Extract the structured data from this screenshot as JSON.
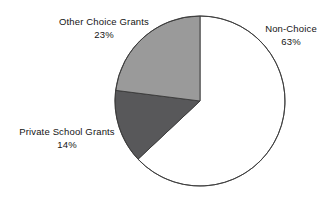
{
  "chart_data": {
    "type": "pie",
    "title": "",
    "subtitle": "",
    "xlabel": "",
    "ylabel": "",
    "legend_position": "none",
    "grid": false,
    "units": "percent",
    "start_angle_deg": 0,
    "direction": "clockwise",
    "categories": [
      "Non-Choice",
      "Private School Grants",
      "Other Choice Grants"
    ],
    "values": [
      63,
      14,
      23
    ],
    "slices": [
      {
        "label": "Non-Choice",
        "value": 63,
        "value_label": "63%",
        "color": "#ffffff",
        "stroke": "#3a3a3a",
        "start_pct": 0,
        "end_pct": 63
      },
      {
        "label": "Private School Grants",
        "value": 14,
        "value_label": "14%",
        "color": "#58585a",
        "stroke": "#3a3a3a",
        "start_pct": 63,
        "end_pct": 77
      },
      {
        "label": "Other Choice Grants",
        "value": 23,
        "value_label": "23%",
        "color": "#9a9a9a",
        "stroke": "#3a3a3a",
        "start_pct": 77,
        "end_pct": 100
      }
    ]
  },
  "labels": {
    "other_choice": {
      "title": "Other Choice Grants",
      "percent": "23%"
    },
    "non_choice": {
      "title": "Non-Choice",
      "percent": "63%"
    },
    "private_school": {
      "title": "Private School Grants",
      "percent": "14%"
    }
  },
  "geometry": {
    "center_x": 200,
    "center_y": 101,
    "radius": 85
  },
  "colors": {
    "background": "#ffffff",
    "outline": "#3a3a3a",
    "slice_light_gray": "#9a9a9a",
    "slice_dark_gray": "#58585a",
    "slice_white": "#ffffff",
    "text": "#141414"
  }
}
